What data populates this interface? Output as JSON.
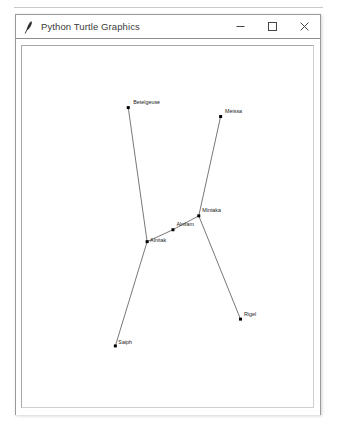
{
  "window": {
    "title": "Python Turtle Graphics",
    "icon": "feather-pen-icon",
    "controls": {
      "minimize_label": "Minimize",
      "maximize_label": "Maximize",
      "close_label": "Close"
    }
  },
  "canvas": {
    "background_color": "#ffffff",
    "line_color": "#3b3b3b",
    "star_color": "#000000",
    "label_color": "#1a1a1a",
    "stars": [
      {
        "name": "Betelgeuse",
        "x": 107.0,
        "y": 62.0,
        "label_dx": 5.0,
        "label_dy": -3.5
      },
      {
        "name": "Meissa",
        "x": 200.0,
        "y": 71.0,
        "label_dx": 4.5,
        "label_dy": -3.5
      },
      {
        "name": "Mintaka",
        "x": 178.0,
        "y": 171.0,
        "label_dx": 3.5,
        "label_dy": -3.5
      },
      {
        "name": "Alnilam",
        "x": 152.0,
        "y": 185.0,
        "label_dx": 3.5,
        "label_dy": -3.5
      },
      {
        "name": "Alnitak",
        "x": 126.0,
        "y": 197.0,
        "label_dx": 3.0,
        "label_dy": 0.5
      },
      {
        "name": "Rigel",
        "x": 220.0,
        "y": 275.0,
        "label_dx": 3.5,
        "label_dy": -3.0
      },
      {
        "name": "Saiph",
        "x": 94.0,
        "y": 302.0,
        "label_dx": 3.0,
        "label_dy": -2.0
      }
    ],
    "connections": [
      {
        "from": "Betelgeuse",
        "to": "Alnitak"
      },
      {
        "from": "Meissa",
        "to": "Mintaka"
      },
      {
        "from": "Mintaka",
        "to": "Alnilam"
      },
      {
        "from": "Alnilam",
        "to": "Alnitak"
      },
      {
        "from": "Alnitak",
        "to": "Saiph"
      },
      {
        "from": "Mintaka",
        "to": "Rigel"
      }
    ]
  }
}
